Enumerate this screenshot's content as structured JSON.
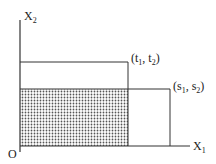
{
  "diagram": {
    "axes": {
      "y_label": {
        "base": "X",
        "sub": "2"
      },
      "x_label": {
        "base": "X",
        "sub": "1"
      },
      "origin_label": "O"
    },
    "points": [
      {
        "id": "t",
        "label": "(t",
        "sub1": "1",
        "mid": ", t",
        "sub2": "2",
        "end": ")"
      },
      {
        "id": "s",
        "label": "(s",
        "sub1": "1",
        "mid": ", s",
        "sub2": "2",
        "end": ")"
      }
    ],
    "colors": {
      "line": "#333333",
      "dot": "#555555",
      "background": "#ffffff"
    }
  }
}
